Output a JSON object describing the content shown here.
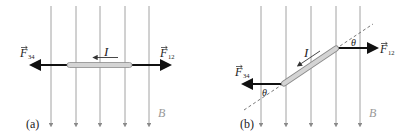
{
  "panels": [
    {
      "id": "a",
      "label": "(a)",
      "force_left": {
        "symbol": "F",
        "subscript": "34"
      },
      "force_right": {
        "symbol": "F",
        "subscript": "12"
      },
      "current_label": "I",
      "field_label": "B"
    },
    {
      "id": "b",
      "label": "(b)",
      "force_left": {
        "symbol": "F",
        "subscript": "34"
      },
      "force_right": {
        "symbol": "F",
        "subscript": "12"
      },
      "current_label": "I",
      "field_label": "B",
      "angle_label": "θ",
      "angle_label_2": "θ"
    }
  ],
  "colors": {
    "field_line": "#8a8a8a",
    "force_arrow": "#111111",
    "rod_fill": "#d4d4d4",
    "rod_stroke": "#8c8c8c",
    "text": "#222222",
    "field_text": "#999999"
  }
}
